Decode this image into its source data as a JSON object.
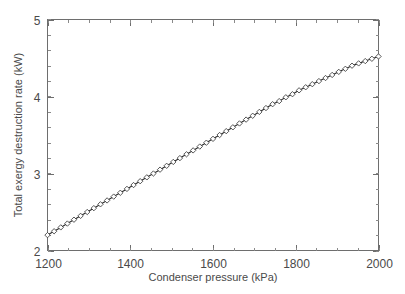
{
  "chart_data": {
    "type": "line",
    "title": "",
    "xlabel": "Condenser pressure (kPa)",
    "ylabel": "Total exergy destruction rate (kW)",
    "xlim": [
      1200,
      2000
    ],
    "ylim": [
      2,
      5
    ],
    "xticks": [
      1200,
      1400,
      1600,
      1800,
      2000
    ],
    "xticklabels": [
      "1200",
      "1400",
      "1600",
      "1800",
      "2000"
    ],
    "yticks": [
      2,
      3,
      4,
      5
    ],
    "yticklabels": [
      "2",
      "3",
      "4",
      "5"
    ],
    "x_minor_tick_step": 50,
    "y_minor_tick_step": 0.2,
    "grid": false,
    "legend": null,
    "frame": "box",
    "tick_direction": "in",
    "marker": "square-open",
    "line_color": "#2b2b2b",
    "axis_color": "#6e6e6e",
    "background_color": "#ffffff",
    "series": [
      {
        "name": "Total exergy destruction rate",
        "x": [
          1200,
          1216,
          1232,
          1248,
          1264,
          1280,
          1296,
          1312,
          1328,
          1344,
          1360,
          1376,
          1392,
          1408,
          1424,
          1440,
          1456,
          1472,
          1488,
          1504,
          1520,
          1536,
          1552,
          1568,
          1584,
          1600,
          1616,
          1632,
          1648,
          1664,
          1680,
          1696,
          1712,
          1728,
          1744,
          1760,
          1776,
          1792,
          1808,
          1824,
          1840,
          1856,
          1872,
          1888,
          1904,
          1920,
          1936,
          1952,
          1968,
          1984,
          2000
        ],
        "values": [
          2.2,
          2.25,
          2.3,
          2.35,
          2.4,
          2.45,
          2.5,
          2.55,
          2.6,
          2.65,
          2.7,
          2.75,
          2.8,
          2.85,
          2.9,
          2.95,
          3.0,
          3.05,
          3.1,
          3.15,
          3.2,
          3.25,
          3.3,
          3.35,
          3.4,
          3.45,
          3.5,
          3.55,
          3.6,
          3.65,
          3.7,
          3.75,
          3.8,
          3.85,
          3.9,
          3.94,
          3.99,
          4.03,
          4.08,
          4.12,
          4.16,
          4.2,
          4.24,
          4.28,
          4.32,
          4.36,
          4.4,
          4.43,
          4.46,
          4.49,
          4.52
        ]
      }
    ]
  },
  "axis_labels": {
    "x_title": "Condenser pressure (kPa)",
    "y_title": "Total exergy destruction rate (kW)"
  }
}
